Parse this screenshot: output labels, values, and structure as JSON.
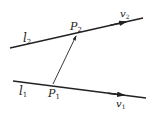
{
  "diagram": {
    "type": "geometry",
    "lines": [
      {
        "name": "l1",
        "label_main": "l",
        "label_sub": "1",
        "point": "P",
        "point_sub": "1",
        "vector": "v",
        "vector_sub": "1"
      },
      {
        "name": "l2",
        "label_main": "l",
        "label_sub": "2",
        "point": "P",
        "point_sub": "2",
        "vector": "v",
        "vector_sub": "2"
      }
    ],
    "connector": {
      "from": "P1",
      "to": "P2"
    },
    "colors": {
      "stroke": "#222222",
      "background": "#ffffff"
    }
  }
}
